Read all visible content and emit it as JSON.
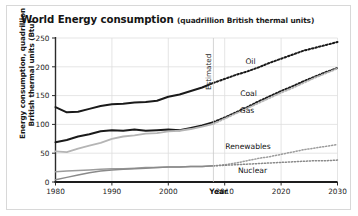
{
  "chart_data": {
    "type": "line",
    "title": "World Energy consumption",
    "subtitle": "(quadrillion British thermal units)",
    "xlabel": "Year",
    "ylabel": "Energy consumption, quadrillion British thermal units (Btu)",
    "ylabel_line1": "Energy consumption, quadrillion",
    "ylabel_line2": "British thermal units (Btu)",
    "xlim": [
      1980,
      2030
    ],
    "ylim": [
      0,
      250
    ],
    "yticks": [
      0,
      50,
      100,
      150,
      200,
      250
    ],
    "xticks": [
      1980,
      1990,
      2000,
      2010,
      2020,
      2030
    ],
    "grid": true,
    "legend": "inline-labels",
    "annotation": "Estimated",
    "annotation_year": 2008,
    "x": [
      1980,
      1982,
      1984,
      1986,
      1988,
      1990,
      1992,
      1994,
      1996,
      1998,
      2000,
      2002,
      2004,
      2006,
      2008,
      2010,
      2012,
      2014,
      2016,
      2018,
      2020,
      2022,
      2024,
      2026,
      2028,
      2030
    ],
    "series": [
      {
        "name": "Oil",
        "color": "#1a1a1a",
        "width": 2.0,
        "values": [
          130,
          121,
          122,
          127,
          132,
          135,
          136,
          138,
          139,
          141,
          148,
          152,
          158,
          164,
          172,
          179,
          186,
          192,
          199,
          207,
          214,
          221,
          228,
          233,
          238,
          243
        ]
      },
      {
        "name": "Coal",
        "color": "#1a1a1a",
        "width": 2.0,
        "values": [
          69,
          73,
          79,
          83,
          88,
          90,
          89,
          91,
          89,
          90,
          91,
          90,
          94,
          98,
          104,
          112,
          121,
          130,
          140,
          149,
          158,
          166,
          175,
          183,
          191,
          198
        ]
      },
      {
        "name": "Gas",
        "color": "#b5b5b5",
        "width": 1.8,
        "values": [
          53,
          52,
          58,
          63,
          68,
          75,
          79,
          81,
          84,
          85,
          88,
          89,
          92,
          96,
          101,
          110,
          119,
          128,
          137,
          146,
          155,
          163,
          172,
          181,
          189,
          197
        ]
      },
      {
        "name": "Renewables",
        "color": "#9c9c9c",
        "width": 1.5,
        "values": [
          18,
          19,
          20,
          21,
          22,
          23,
          23,
          24,
          25,
          25,
          26,
          26,
          27,
          27,
          28,
          30,
          33,
          37,
          41,
          44,
          48,
          52,
          56,
          59,
          62,
          65
        ]
      },
      {
        "name": "Nuclear",
        "color": "#8a8a8a",
        "width": 1.5,
        "values": [
          4,
          8,
          12,
          16,
          19,
          21,
          22,
          23,
          24,
          25,
          26,
          26,
          27,
          27,
          28,
          29,
          30,
          31,
          32,
          33,
          34,
          35,
          36,
          37,
          37,
          38
        ]
      }
    ]
  },
  "labels": {
    "oil": "Oil",
    "coal": "Coal",
    "gas": "Gas",
    "renewables": "Renewables",
    "nuclear": "Nuclear",
    "estimated": "Estimated",
    "year": "Year"
  }
}
